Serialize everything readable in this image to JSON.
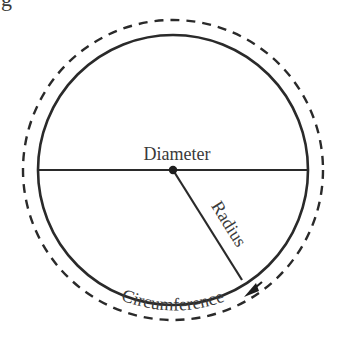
{
  "diagram": {
    "type": "circle-parts",
    "partial_top_left_glyph": "g",
    "labels": {
      "diameter": "Diameter",
      "radius": "Radius",
      "circumference": "Circumference"
    },
    "colors": {
      "stroke": "#2a2a2a",
      "text": "#3a3a3a",
      "background": "#ffffff"
    },
    "geometry": {
      "center": [
        173,
        170
      ],
      "circle_radius": 135,
      "dashed_radius": 150,
      "radius_end": [
        242,
        280
      ]
    }
  }
}
